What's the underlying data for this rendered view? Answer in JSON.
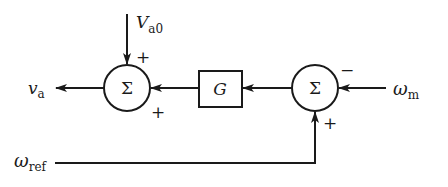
{
  "diagram": {
    "type": "control-block-diagram",
    "summing_junction_symbol": "Σ",
    "blocks": [
      {
        "id": "G",
        "label": "G"
      }
    ],
    "summers": [
      {
        "id": "sum_left",
        "symbol": "Σ",
        "signs": {
          "top": "+",
          "right": "+"
        }
      },
      {
        "id": "sum_right",
        "symbol": "Σ",
        "signs": {
          "right": "−",
          "bottom": "+"
        }
      }
    ],
    "signals": {
      "va": {
        "main": "v",
        "sub": "a"
      },
      "Va0": {
        "main": "V",
        "sub": "a0"
      },
      "wm": {
        "main": "ω",
        "sub": "m"
      },
      "wref": {
        "main": "ω",
        "sub": "ref"
      }
    },
    "signs": {
      "left_top": "+",
      "left_right": "+",
      "right_right": "−",
      "right_bottom": "+"
    },
    "stroke_color": "#1a1a1a"
  }
}
